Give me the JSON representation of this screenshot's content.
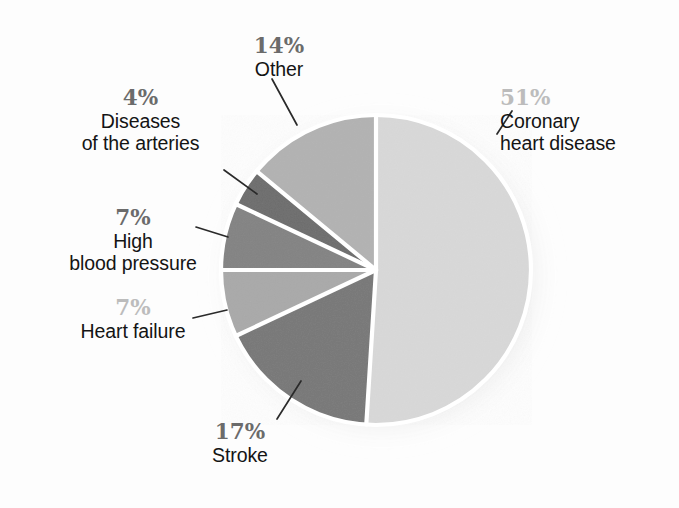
{
  "figure": {
    "background_color": "#fdfdfd",
    "shadow_color": "#c9c9c9",
    "separator_color": "#ffffff",
    "leader_line_color": "#2a2a2a",
    "pct_color_dark": "#6b6b6b",
    "pct_color_light": "#bcbcbc",
    "text_color": "#141414"
  },
  "chart_data": {
    "type": "pie",
    "title": "",
    "subtitle": "",
    "xlabel": "",
    "ylabel": "",
    "grid": false,
    "legend_position": "callout-labels",
    "start_angle_deg": 0,
    "direction": "clockwise",
    "center": {
      "x": 376,
      "y": 270
    },
    "radius": 155,
    "units": "percent",
    "total": 100,
    "categories": [
      "Coronary heart disease",
      "Stroke",
      "Heart failure",
      "High blood pressure",
      "Diseases of the arteries",
      "Other"
    ],
    "values": [
      51,
      17,
      7,
      7,
      4,
      14
    ],
    "slices": [
      {
        "id": "coronary-heart-disease",
        "label": "Coronary heart disease",
        "label_lines": [
          "Coronary",
          "heart disease"
        ],
        "percent_text": "51%",
        "value": 51,
        "color": "#d8d8d8",
        "pct_style": "light",
        "start_deg": 0,
        "end_deg": 183.6
      },
      {
        "id": "stroke",
        "label": "Stroke",
        "label_lines": [
          "Stroke"
        ],
        "percent_text": "17%",
        "value": 17,
        "color": "#787878",
        "pct_style": "dark",
        "start_deg": 183.6,
        "end_deg": 244.8
      },
      {
        "id": "heart-failure",
        "label": "Heart failure",
        "label_lines": [
          "Heart failure"
        ],
        "percent_text": "7%",
        "value": 7,
        "color": "#a9a9a9",
        "pct_style": "light",
        "start_deg": 244.8,
        "end_deg": 270.0
      },
      {
        "id": "high-blood-pressure",
        "label": "High blood pressure",
        "label_lines": [
          "High",
          "blood pressure"
        ],
        "percent_text": "7%",
        "value": 7,
        "color": "#838383",
        "pct_style": "dark",
        "start_deg": 270.0,
        "end_deg": 295.2
      },
      {
        "id": "diseases-of-the-arteries",
        "label": "Diseases of the arteries",
        "label_lines": [
          "Diseases",
          "of the arteries"
        ],
        "percent_text": "4%",
        "value": 4,
        "color": "#6d6d6d",
        "pct_style": "dark",
        "start_deg": 295.2,
        "end_deg": 309.6
      },
      {
        "id": "other",
        "label": "Other",
        "label_lines": [
          "Other"
        ],
        "percent_text": "14%",
        "value": 14,
        "color": "#b2b2b2",
        "pct_style": "dark",
        "start_deg": 309.6,
        "end_deg": 360.0
      }
    ]
  },
  "labels": {
    "other": {
      "pct": "14%",
      "line1": "Other",
      "line2": ""
    },
    "arteries": {
      "pct": "4%",
      "line1": "Diseases",
      "line2": "of the arteries"
    },
    "hbp": {
      "pct": "7%",
      "line1": "High",
      "line2": "blood pressure"
    },
    "hf": {
      "pct": "7%",
      "line1": "Heart failure",
      "line2": ""
    },
    "stroke": {
      "pct": "17%",
      "line1": "Stroke",
      "line2": ""
    },
    "chd": {
      "pct": "51%",
      "line1": "Coronary",
      "line2": "heart disease"
    }
  }
}
